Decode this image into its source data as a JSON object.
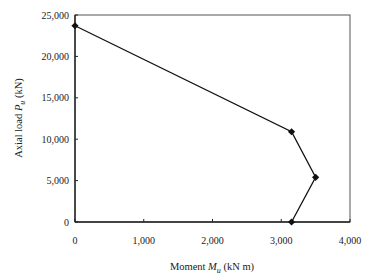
{
  "chart_data": {
    "type": "line",
    "title": "",
    "xlabel": "Moment M_u (kN m)",
    "ylabel": "Axial load P_u (kN)",
    "xlabel_parts": {
      "prefix": "Moment ",
      "var": "M",
      "sub": "u",
      "suffix": " (kN m)"
    },
    "ylabel_parts": {
      "prefix": "Axial load ",
      "var": "P",
      "sub": "u",
      "suffix": " (kN)"
    },
    "xlim": [
      0,
      4000
    ],
    "ylim": [
      0,
      25000
    ],
    "xticks": [
      0,
      1000,
      2000,
      3000,
      4000
    ],
    "xtick_labels": [
      "0",
      "1,000",
      "2,000",
      "3,000",
      "4,000"
    ],
    "yticks": [
      0,
      5000,
      10000,
      15000,
      20000,
      25000
    ],
    "ytick_labels": [
      "0",
      "5,000",
      "10,000",
      "15,000",
      "20,000",
      "25,000"
    ],
    "grid": false,
    "legend": null,
    "series": [
      {
        "name": "Interaction diagram",
        "marker": "diamond",
        "color": "#111111",
        "x": [
          0,
          3150,
          3500,
          3150
        ],
        "y": [
          23700,
          10900,
          5400,
          0
        ]
      }
    ]
  }
}
